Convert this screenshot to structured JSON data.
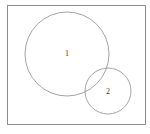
{
  "figure": {
    "type": "venn-diagram",
    "background_color": "#ffffff",
    "frame": {
      "name": "bounding-rectangle",
      "x": 7,
      "y": 5,
      "width": 138,
      "height": 119,
      "stroke_color": "#8c8c8c",
      "stroke_width": 1,
      "fill": "none"
    },
    "shapes": [
      {
        "name": "circle-1",
        "label": "1",
        "cx": 67,
        "cy": 54,
        "r": 42,
        "label_x": 67,
        "label_y": 56,
        "stroke_color": "#8c8c8c",
        "stroke_width": 0.8,
        "fill": "none"
      },
      {
        "name": "circle-2",
        "label": "2",
        "cx": 108,
        "cy": 91,
        "r": 23,
        "label_x": 108,
        "label_y": 94,
        "stroke_color": "#8c8c8c",
        "stroke_width": 0.8,
        "fill": "none"
      }
    ],
    "label_color": "#3a3a3a",
    "label_font_size": 8
  }
}
